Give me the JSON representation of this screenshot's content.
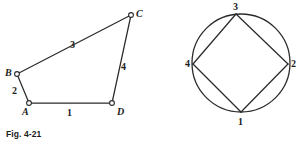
{
  "page": {
    "background_color": "#ffffff",
    "ink_color": "#2b2b2b"
  },
  "figures": [
    {
      "id": "fig-4-21",
      "caption": "Fig. 4-21",
      "type": "quadrilateral",
      "description": "Irregular quadrilateral ABCD with open-circle vertices and numbered sides",
      "vertices": [
        {
          "label": "A",
          "x": 29,
          "y": 103
        },
        {
          "label": "B",
          "x": 17,
          "y": 74
        },
        {
          "label": "C",
          "x": 131,
          "y": 15
        },
        {
          "label": "D",
          "x": 112,
          "y": 103
        }
      ],
      "vertex_label_positions": [
        {
          "label": "A",
          "x": 22,
          "y": 107
        },
        {
          "label": "B",
          "x": 5,
          "y": 68
        },
        {
          "label": "C",
          "x": 136,
          "y": 9
        },
        {
          "label": "D",
          "x": 117,
          "y": 107
        }
      ],
      "sides": [
        {
          "label": "1",
          "from": "A",
          "to": "D",
          "label_x": 67,
          "label_y": 108
        },
        {
          "label": "2",
          "from": "A",
          "to": "B",
          "label_x": 12,
          "label_y": 86
        },
        {
          "label": "3",
          "from": "B",
          "to": "C",
          "label_x": 70,
          "label_y": 40
        },
        {
          "label": "4",
          "from": "C",
          "to": "D",
          "label_x": 121,
          "label_y": 62
        }
      ]
    },
    {
      "id": "fig-4-22",
      "caption": "Fig. 4-22",
      "type": "circle-with-inscribed-quadrilateral",
      "description": "Circle with an inscribed quadrilateral whose vertices are numbered 1 through 4",
      "circle": {
        "cx": 93,
        "cy": 63,
        "r": 49
      },
      "vertices": [
        {
          "label": "1",
          "x": 93,
          "y": 112
        },
        {
          "label": "2",
          "x": 140,
          "y": 64
        },
        {
          "label": "3",
          "x": 88,
          "y": 14
        },
        {
          "label": "4",
          "x": 45,
          "y": 64
        }
      ],
      "vertex_label_positions": [
        {
          "label": "1",
          "x": 90,
          "y": 117
        },
        {
          "label": "2",
          "x": 143,
          "y": 59
        },
        {
          "label": "3",
          "x": 85,
          "y": 2
        },
        {
          "label": "4",
          "x": 37,
          "y": 59
        }
      ],
      "chords": [
        {
          "from": "1",
          "to": "2"
        },
        {
          "from": "2",
          "to": "3"
        },
        {
          "from": "3",
          "to": "4"
        },
        {
          "from": "4",
          "to": "1"
        }
      ]
    }
  ]
}
